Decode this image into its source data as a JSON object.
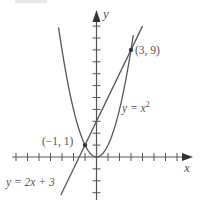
{
  "chart_data": {
    "type": "line",
    "title": "",
    "xlabel": "x",
    "ylabel": "y",
    "xlim": [
      -7.5,
      8
    ],
    "ylim": [
      -3.5,
      12
    ],
    "grid": false,
    "x_ticks": [
      -7,
      -6,
      -5,
      -4,
      -3,
      -2,
      -1,
      1,
      2,
      3,
      4,
      5,
      6,
      7
    ],
    "y_ticks": [
      -3,
      -2,
      -1,
      1,
      2,
      3,
      4,
      5,
      6,
      7,
      8,
      9,
      10,
      11
    ],
    "series": [
      {
        "name": "y = x^2",
        "label": "y = x",
        "label_sup": "2",
        "equation": "y = x^2",
        "x_range": [
          -3.3,
          3.2
        ],
        "color": "#555555"
      },
      {
        "name": "y = 2x + 3",
        "label": "y = 2x + 3",
        "equation": "y = 2x + 3",
        "x_range": [
          -3.1,
          4.0
        ],
        "color": "#555555"
      }
    ],
    "points": [
      {
        "x": -1,
        "y": 1,
        "label": "(−1, 1)"
      },
      {
        "x": 3,
        "y": 9,
        "label": "(3, 9)"
      }
    ],
    "annotations": [
      "(−1, 1)",
      "(3, 9)",
      "y = x²",
      "y = 2x + 3"
    ]
  },
  "axes": {
    "x_label": "x",
    "y_label": "y"
  },
  "labels": {
    "point_a": "(−1, 1)",
    "point_b": "(3, 9)",
    "parabola_prefix": "y = x",
    "parabola_sup": "2",
    "line": "y = 2x + 3"
  }
}
